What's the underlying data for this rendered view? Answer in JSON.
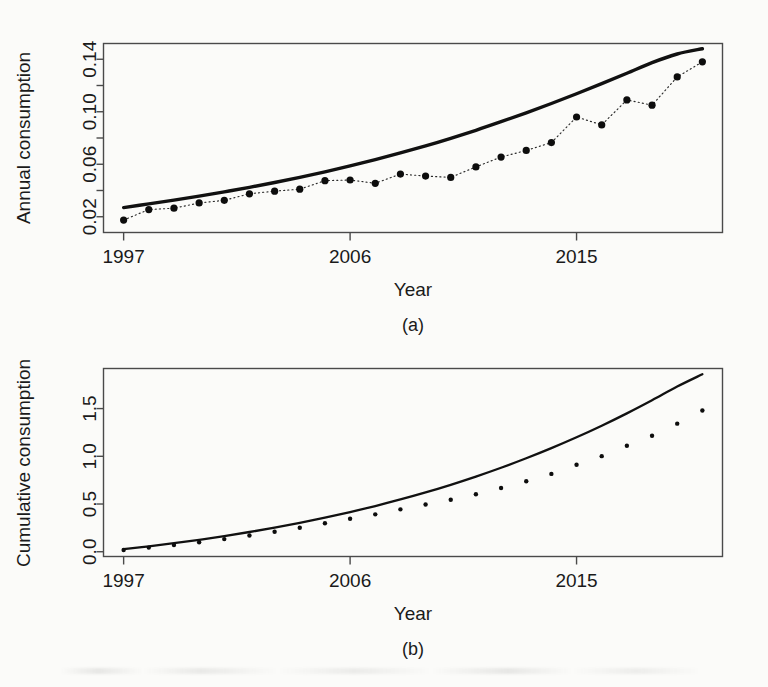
{
  "figure": {
    "background": "#fbfbf9",
    "ink_color": "#111111",
    "panel_a_label": "(a)",
    "panel_b_label": "(b)"
  },
  "chart_data": [
    {
      "type": "scatter",
      "panel": "(a)",
      "title": "",
      "xlabel": "Year",
      "ylabel": "Annual consumption",
      "xlim": [
        1996.2,
        2020.8
      ],
      "ylim": [
        0.008,
        0.152
      ],
      "xticks": [
        1997,
        2006,
        2015
      ],
      "xtick_labels": [
        "1997",
        "2006",
        "2015"
      ],
      "yticks": [
        0.02,
        0.04,
        0.06,
        0.08,
        0.1,
        0.12,
        0.14
      ],
      "ytick_labels": [
        "0.02",
        "",
        "0.06",
        "",
        "0.10",
        "",
        "0.14"
      ],
      "grid": false,
      "legend": "none",
      "x": [
        1997,
        1998,
        1999,
        2000,
        2001,
        2002,
        2003,
        2004,
        2005,
        2006,
        2007,
        2008,
        2009,
        2010,
        2011,
        2012,
        2013,
        2014,
        2015,
        2016,
        2017,
        2018,
        2019,
        2020
      ],
      "series": [
        {
          "name": "Observed annual consumption",
          "style": "points-dotted",
          "values": [
            0.0175,
            0.0255,
            0.0265,
            0.0305,
            0.0325,
            0.0375,
            0.0395,
            0.041,
            0.0475,
            0.048,
            0.0455,
            0.0525,
            0.051,
            0.05,
            0.058,
            0.0655,
            0.0705,
            0.0765,
            0.096,
            0.09,
            0.109,
            0.105,
            0.1265,
            0.138
          ]
        },
        {
          "name": "Fitted curve",
          "style": "smooth-line",
          "values": [
            0.027,
            0.0298,
            0.0327,
            0.0357,
            0.039,
            0.0424,
            0.0461,
            0.05,
            0.0542,
            0.0587,
            0.0635,
            0.0686,
            0.074,
            0.0798,
            0.0859,
            0.0924,
            0.0992,
            0.1063,
            0.1137,
            0.1214,
            0.1293,
            0.1374,
            0.144,
            0.148
          ]
        }
      ]
    },
    {
      "type": "scatter",
      "panel": "(b)",
      "title": "",
      "xlabel": "Year",
      "ylabel": "Cumulative consumption",
      "xlim": [
        1996.2,
        2020.8
      ],
      "ylim": [
        -0.05,
        1.92
      ],
      "xticks": [
        1997,
        2006,
        2015
      ],
      "xtick_labels": [
        "1997",
        "2006",
        "2015"
      ],
      "yticks": [
        0.0,
        0.5,
        1.0,
        1.5
      ],
      "ytick_labels": [
        "0.0",
        "0.5",
        "1.0",
        "1.5"
      ],
      "grid": false,
      "legend": "none",
      "x": [
        1997,
        1998,
        1999,
        2000,
        2001,
        2002,
        2003,
        2004,
        2005,
        2006,
        2007,
        2008,
        2009,
        2010,
        2011,
        2012,
        2013,
        2014,
        2015,
        2016,
        2017,
        2018,
        2019,
        2020
      ],
      "series": [
        {
          "name": "Observed cumulative consumption",
          "style": "points",
          "values": [
            0.0175,
            0.043,
            0.0695,
            0.1,
            0.1325,
            0.17,
            0.2095,
            0.2505,
            0.298,
            0.346,
            0.3915,
            0.444,
            0.495,
            0.545,
            0.603,
            0.6685,
            0.739,
            0.8155,
            0.9115,
            1.0015,
            1.1105,
            1.2155,
            1.342,
            1.48
          ]
        },
        {
          "name": "Fitted cumulative curve",
          "style": "smooth-line",
          "values": [
            0.027,
            0.0568,
            0.0895,
            0.1252,
            0.1642,
            0.2066,
            0.2527,
            0.3027,
            0.3569,
            0.4156,
            0.4791,
            0.5477,
            0.6217,
            0.7015,
            0.7874,
            0.8798,
            0.979,
            1.0853,
            1.199,
            1.3204,
            1.4497,
            1.5871,
            1.7311,
            1.86
          ]
        }
      ]
    }
  ]
}
